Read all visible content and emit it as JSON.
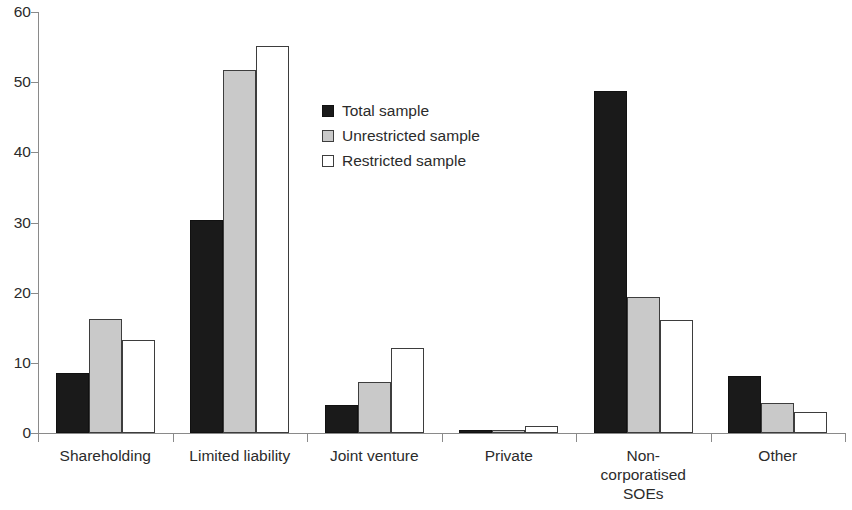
{
  "chart_data": {
    "type": "bar",
    "title": "",
    "subtitle": "",
    "xlabel": "",
    "ylabel": "",
    "grid": false,
    "legend_position": "inside-upper-center",
    "ylim": [
      0,
      60
    ],
    "yticks": [
      0,
      10,
      20,
      30,
      40,
      50,
      60
    ],
    "ytick_labels": [
      "0",
      "10",
      "20",
      "30",
      "40",
      "50",
      "60"
    ],
    "categories": [
      "Shareholding",
      "Limited liability",
      "Joint venture",
      "Private",
      "Non-corporatised SOEs",
      "Other"
    ],
    "category_label_lines": [
      [
        "Shareholding"
      ],
      [
        "Limited liability"
      ],
      [
        "Joint venture"
      ],
      [
        "Private"
      ],
      [
        "Non-",
        "corporatised",
        "SOEs"
      ],
      [
        "Other"
      ]
    ],
    "series": [
      {
        "name": "Total sample",
        "color": "#1a1a1a",
        "values": [
          8.5,
          30.4,
          4.0,
          0.5,
          48.8,
          8.1
        ]
      },
      {
        "name": "Unrestricted sample",
        "color": "#c9c9c9",
        "values": [
          16.3,
          51.8,
          7.2,
          0.4,
          19.4,
          4.3
        ]
      },
      {
        "name": "Restricted sample",
        "color": "#ffffff",
        "values": [
          13.2,
          55.2,
          12.1,
          1.0,
          16.1,
          3.0
        ]
      }
    ]
  },
  "legend": {
    "items": [
      {
        "label": "Total sample"
      },
      {
        "label": "Unrestricted sample"
      },
      {
        "label": "Restricted sample"
      }
    ]
  },
  "axis_colors": {
    "line": "#8a8a8a",
    "text": "#2b2b2b"
  }
}
